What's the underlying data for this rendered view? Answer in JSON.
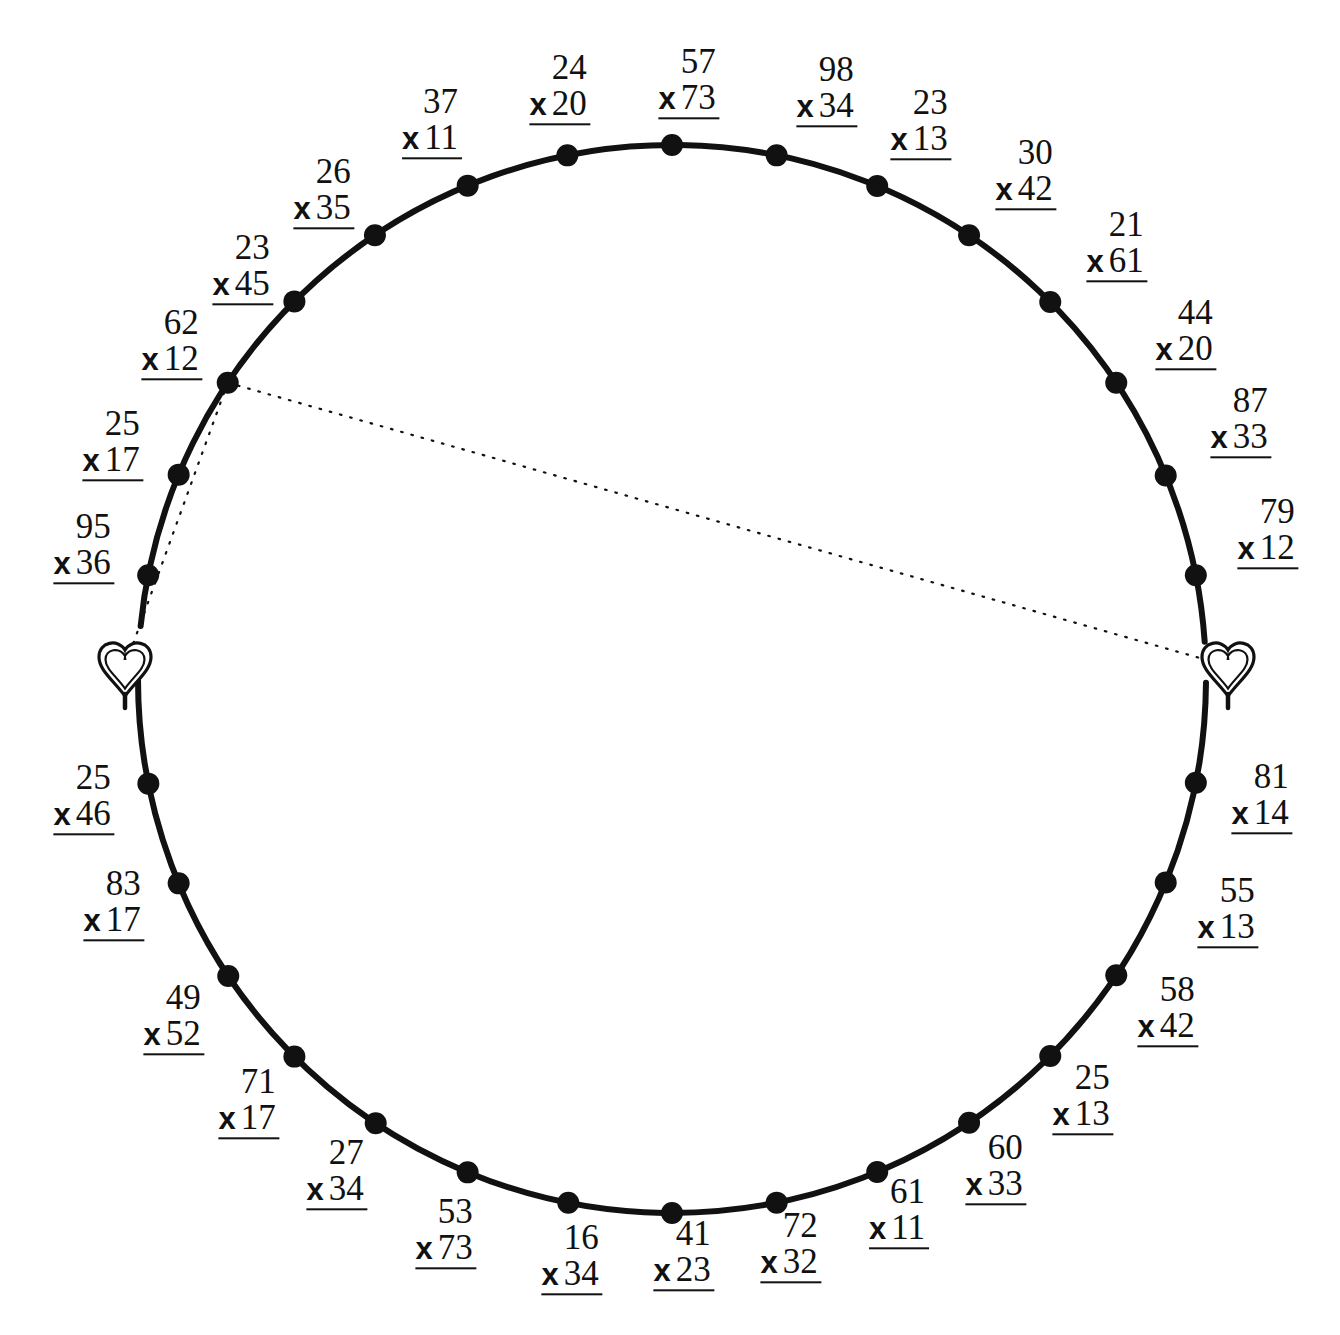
{
  "page": {
    "kind": "worksheet",
    "background_color": "#ffffff",
    "ink_color": "#111111"
  },
  "figure": {
    "shape": "circle",
    "center_x": 672,
    "center_y": 679,
    "radius": 534,
    "stroke_width": 6,
    "dot_radius": 11,
    "label_offset": 92
  },
  "hearts": [
    {
      "name": "heart-left",
      "x": 125,
      "y": 664,
      "angle_deg": 183.5
    },
    {
      "name": "heart-right",
      "x": 1228,
      "y": 664,
      "angle_deg": -1.8
    }
  ],
  "connector_lines": [
    {
      "name": "connector-left",
      "from_index": 28,
      "to_heart": 0
    },
    {
      "name": "connector-right",
      "from_index": 28,
      "to_heart": 1
    }
  ],
  "operator": "x",
  "problems": [
    {
      "index": 0,
      "top": "57",
      "op": "x",
      "bottom": "73",
      "angle_deg": -90
    },
    {
      "index": 1,
      "top": "98",
      "op": "x",
      "bottom": "34",
      "angle_deg": -78.75
    },
    {
      "index": 2,
      "top": "23",
      "op": "x",
      "bottom": "13",
      "angle_deg": -67.5
    },
    {
      "index": 3,
      "top": "30",
      "op": "x",
      "bottom": "42",
      "angle_deg": -56.25
    },
    {
      "index": 4,
      "top": "21",
      "op": "x",
      "bottom": "61",
      "angle_deg": -45
    },
    {
      "index": 5,
      "top": "44",
      "op": "x",
      "bottom": "20",
      "angle_deg": -33.75
    },
    {
      "index": 6,
      "top": "87",
      "op": "x",
      "bottom": "33",
      "angle_deg": -22.5
    },
    {
      "index": 7,
      "top": "79",
      "op": "x",
      "bottom": "12",
      "angle_deg": -11.25
    },
    {
      "index": 8,
      "top": "81",
      "op": "x",
      "bottom": "14",
      "angle_deg": 11.25
    },
    {
      "index": 9,
      "top": "55",
      "op": "x",
      "bottom": "13",
      "angle_deg": 22.5
    },
    {
      "index": 10,
      "top": "58",
      "op": "x",
      "bottom": "42",
      "angle_deg": 33.75
    },
    {
      "index": 11,
      "top": "25",
      "op": "x",
      "bottom": "13",
      "angle_deg": 45
    },
    {
      "index": 12,
      "top": "60",
      "op": "x",
      "bottom": "33",
      "angle_deg": 56.25
    },
    {
      "index": 13,
      "top": "61",
      "op": "x",
      "bottom": "11",
      "angle_deg": 67.5
    },
    {
      "index": 14,
      "top": "72",
      "op": "x",
      "bottom": "32",
      "angle_deg": 78.75
    },
    {
      "index": 15,
      "top": "41",
      "op": "x",
      "bottom": "23",
      "angle_deg": 90
    },
    {
      "index": 16,
      "top": "16",
      "op": "x",
      "bottom": "34",
      "angle_deg": 101.25
    },
    {
      "index": 17,
      "top": "53",
      "op": "x",
      "bottom": "73",
      "angle_deg": 112.5
    },
    {
      "index": 18,
      "top": "27",
      "op": "x",
      "bottom": "34",
      "angle_deg": 123.75
    },
    {
      "index": 19,
      "top": "71",
      "op": "x",
      "bottom": "17",
      "angle_deg": 135
    },
    {
      "index": 20,
      "top": "49",
      "op": "x",
      "bottom": "52",
      "angle_deg": 146.25
    },
    {
      "index": 21,
      "top": "83",
      "op": "x",
      "bottom": "17",
      "angle_deg": 157.5
    },
    {
      "index": 22,
      "top": "25",
      "op": "x",
      "bottom": "46",
      "angle_deg": 168.75
    },
    {
      "index": 23,
      "top": "95",
      "op": "x",
      "bottom": "36",
      "angle_deg": 191.25
    },
    {
      "index": 24,
      "top": "25",
      "op": "x",
      "bottom": "17",
      "angle_deg": 202.5
    },
    {
      "index": 25,
      "top": "62",
      "op": "x",
      "bottom": "12",
      "angle_deg": 213.75
    },
    {
      "index": 26,
      "top": "23",
      "op": "x",
      "bottom": "45",
      "angle_deg": 225
    },
    {
      "index": 27,
      "top": "26",
      "op": "x",
      "bottom": "35",
      "angle_deg": 236.25
    },
    {
      "index": 28,
      "top": "37",
      "op": "x",
      "bottom": "11",
      "angle_deg": 247.5
    },
    {
      "index": 29,
      "top": "24",
      "op": "x",
      "bottom": "20",
      "angle_deg": 258.75
    },
    {
      "index": 30,
      "top": "23",
      "op": "x",
      "bottom": "13",
      "angle_deg": -67.5
    },
    {
      "index": 31,
      "top": "30",
      "op": "x",
      "bottom": "42",
      "angle_deg": -56.25
    }
  ],
  "layout": {
    "problem_positions": [
      {
        "label_x": 689,
        "label_y": 82,
        "dot_deg": -90.0
      },
      {
        "label_x": 827,
        "label_y": 90,
        "dot_deg": -78.7
      },
      {
        "label_x": 921,
        "label_y": 123,
        "dot_deg": -67.4
      },
      {
        "label_x": 1026,
        "label_y": 173,
        "dot_deg": -56.2
      },
      {
        "label_x": 1117,
        "label_y": 245,
        "dot_deg": -44.9
      },
      {
        "label_x": 1186,
        "label_y": 333,
        "dot_deg": -33.7
      },
      {
        "label_x": 1241,
        "label_y": 421,
        "dot_deg": -22.4
      },
      {
        "label_x": 1268,
        "label_y": 532,
        "dot_deg": -11.2
      },
      {
        "label_x": 1262,
        "label_y": 797,
        "dot_deg": 11.2
      },
      {
        "label_x": 1228,
        "label_y": 911,
        "dot_deg": 22.4
      },
      {
        "label_x": 1168,
        "label_y": 1010,
        "dot_deg": 33.7
      },
      {
        "label_x": 1083,
        "label_y": 1098,
        "dot_deg": 44.9
      },
      {
        "label_x": 996,
        "label_y": 1168,
        "dot_deg": 56.2
      },
      {
        "label_x": 899,
        "label_y": 1212,
        "dot_deg": 67.4
      },
      {
        "label_x": 791,
        "label_y": 1246,
        "dot_deg": 78.7
      },
      {
        "label_x": 684,
        "label_y": 1254,
        "dot_deg": 90.0
      },
      {
        "label_x": 572,
        "label_y": 1258,
        "dot_deg": 101.2
      },
      {
        "label_x": 446,
        "label_y": 1232,
        "dot_deg": 112.5
      },
      {
        "label_x": 337,
        "label_y": 1173,
        "dot_deg": 123.7
      },
      {
        "label_x": 249,
        "label_y": 1102,
        "dot_deg": 135.0
      },
      {
        "label_x": 174,
        "label_y": 1018,
        "dot_deg": 146.2
      },
      {
        "label_x": 114,
        "label_y": 904,
        "dot_deg": 157.5
      },
      {
        "label_x": 84,
        "label_y": 798,
        "dot_deg": 168.7
      },
      {
        "label_x": 84,
        "label_y": 547,
        "dot_deg": 191.2
      },
      {
        "label_x": 113,
        "label_y": 444,
        "dot_deg": 202.5
      },
      {
        "label_x": 172,
        "label_y": 343,
        "dot_deg": 213.7
      },
      {
        "label_x": 243,
        "label_y": 268,
        "dot_deg": 225.0
      },
      {
        "label_x": 324,
        "label_y": 192,
        "dot_deg": 236.2
      },
      {
        "label_x": 432,
        "label_y": 122,
        "dot_deg": 247.5
      },
      {
        "label_x": 560,
        "label_y": 88,
        "dot_deg": 258.7
      }
    ]
  }
}
